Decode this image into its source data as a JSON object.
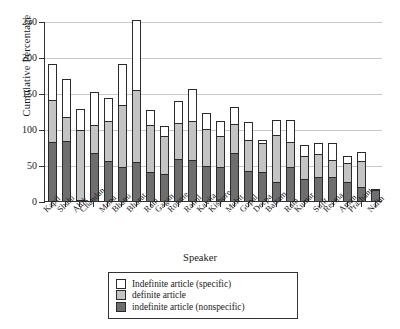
{
  "chart_data": {
    "type": "bar",
    "title": "",
    "xlabel": "Speaker",
    "ylabel": "Cumulative Percentage",
    "ylim": [
      0,
      250
    ],
    "yticks": [
      0,
      50,
      100,
      150,
      200,
      250
    ],
    "grid": true,
    "stacked": true,
    "legend_position": "bottom-center",
    "categories": [
      "Kapil",
      "Shalu",
      "Alok",
      "Chandan",
      "Mona",
      "Bhanu",
      "Bharat",
      "Rani",
      "Gagan",
      "Ronnie",
      "Rahul",
      "Kavita",
      "Kishore",
      "Mohit",
      "Gopal",
      "Deepa",
      "Balram",
      "Ram",
      "Kumar",
      "Sujit",
      "Reema",
      "Aman",
      "Prashant",
      "Nalin"
    ],
    "series": [
      {
        "name": "indefinite article (nonspecific)",
        "color": "#6e6e6e",
        "values": [
          82,
          84,
          2,
          67,
          55,
          47,
          54,
          40,
          37,
          59,
          57,
          48,
          47,
          67,
          41,
          40,
          27,
          47,
          30,
          33,
          33,
          26,
          20,
          15
        ]
      },
      {
        "name": "definite article",
        "color": "#c4c4c4",
        "values": [
          58,
          33,
          97,
          38,
          56,
          87,
          100,
          66,
          54,
          49,
          54,
          52,
          43,
          40,
          44,
          40,
          65,
          35,
          32,
          32,
          24,
          27,
          36,
          1
        ]
      },
      {
        "name": "Indefinite article (specific)",
        "color": "#ffffff",
        "values": [
          50,
          52,
          29,
          46,
          32,
          56,
          97,
          20,
          13,
          31,
          45,
          22,
          21,
          23,
          25,
          5,
          20,
          30,
          16,
          15,
          23,
          10,
          12,
          0
        ]
      }
    ],
    "totals": [
      190,
      169,
      128,
      151,
      143,
      190,
      251,
      126,
      104,
      139,
      156,
      122,
      111,
      130,
      110,
      85,
      112,
      112,
      78,
      80,
      80,
      63,
      68,
      16
    ]
  },
  "legend": {
    "items": [
      {
        "label": "Indefinite article (specific)",
        "swatch": "spec"
      },
      {
        "label": "definite article",
        "swatch": "def"
      },
      {
        "label": "indefinite article (nonspecific)",
        "swatch": "nonspec"
      }
    ]
  }
}
